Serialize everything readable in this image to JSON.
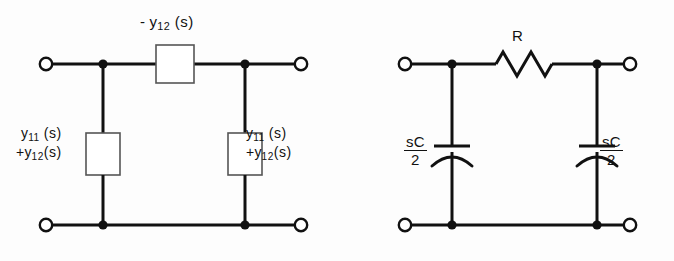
{
  "figure": {
    "background_color": "#fdfdfd",
    "ink_color": "#111111"
  },
  "circuits": [
    {
      "id": "admittance-pi-network",
      "name": "General pi-network with admittance boxes",
      "series_element": {
        "type": "box",
        "label_main": "- y",
        "label_subscript": "12",
        "label_suffix": "(s)",
        "label_full": "- y12 (s)"
      },
      "shunt_left": {
        "type": "box",
        "line1_main": "y",
        "line1_subscript": "11",
        "line1_suffix": "(s)",
        "line2_main": "+y",
        "line2_subscript": "12",
        "line2_suffix": "(s)",
        "label_full": "y11 (s) +y12 (s)"
      },
      "shunt_right": {
        "type": "box",
        "line1_main": "y",
        "line1_subscript": "11",
        "line1_suffix": "(s)",
        "line2_main": "+y",
        "line2_subscript": "12",
        "line2_suffix": "(s)",
        "label_full": "y11 (s) +y12 (s)"
      },
      "terminals": 4,
      "nodes": 4
    },
    {
      "id": "rc-pi-network",
      "name": "RC pi-network realization",
      "series_element": {
        "type": "resistor",
        "label": "R",
        "zigzag_peaks": 3
      },
      "shunt_left": {
        "type": "capacitor",
        "numerator": "sC",
        "denominator": "2",
        "label_full": "sC/2"
      },
      "shunt_right": {
        "type": "capacitor",
        "numerator": "sC",
        "denominator": "2",
        "label_full": "sC/2"
      },
      "terminals": 4,
      "nodes": 4
    }
  ]
}
